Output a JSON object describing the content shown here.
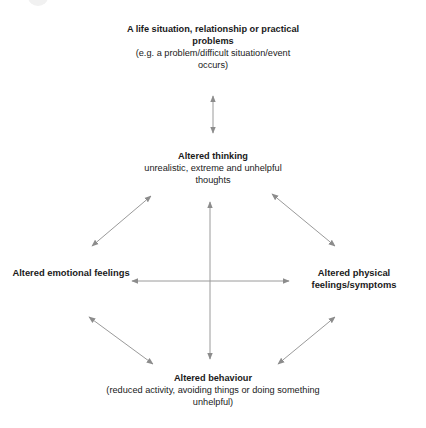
{
  "diagram": {
    "type": "cognitive-behavioural-cycle",
    "colors": {
      "background": "#ffffff",
      "text": "#1a1a1a",
      "arrow": "#9a9a9a"
    },
    "nodes": {
      "situation": {
        "title": "A life situation, relationship or practical problems",
        "subtitle": "(e.g. a problem/difficult situation/event occurs)"
      },
      "thinking": {
        "title": "Altered thinking",
        "subtitle": "unrealistic, extreme and unhelpful thoughts"
      },
      "emotional": {
        "title": "Altered emotional feelings"
      },
      "physical": {
        "title": "Altered physical feelings/symptoms"
      },
      "behaviour": {
        "title": "Altered behaviour",
        "subtitle": "(reduced activity, avoiding things or doing something unhelpful)"
      }
    },
    "connections": [
      {
        "from": "situation",
        "to": "thinking",
        "bidirectional": true
      },
      {
        "from": "thinking",
        "to": "emotional",
        "bidirectional": true
      },
      {
        "from": "thinking",
        "to": "physical",
        "bidirectional": true
      },
      {
        "from": "thinking",
        "to": "behaviour",
        "bidirectional": true
      },
      {
        "from": "emotional",
        "to": "physical",
        "bidirectional": true
      },
      {
        "from": "emotional",
        "to": "behaviour",
        "bidirectional": true
      },
      {
        "from": "physical",
        "to": "behaviour",
        "bidirectional": true
      }
    ]
  }
}
